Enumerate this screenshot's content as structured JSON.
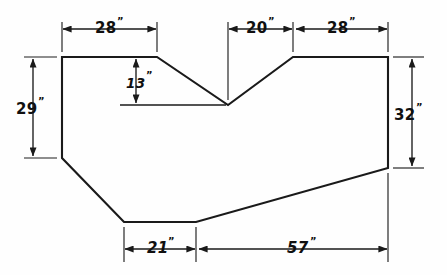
{
  "drawing": {
    "title": "Dimensioned plan outline with V-notch",
    "units_mark": "”",
    "stroke_color": "#1a1a1a",
    "background_color": "#fefefe",
    "canvas": {
      "width": 447,
      "height": 275
    }
  },
  "dimensions": {
    "top_left": {
      "label": "28",
      "mark": "”",
      "value": 28,
      "unit": "in",
      "position": "top",
      "span": "left flat edge"
    },
    "top_notch": {
      "label": "20",
      "mark": "”",
      "value": 20,
      "unit": "in",
      "position": "top",
      "span": "notch right slope run"
    },
    "top_right": {
      "label": "28",
      "mark": "”",
      "value": 28,
      "unit": "in",
      "position": "top",
      "span": "right flat edge"
    },
    "notch_depth": {
      "label": "13",
      "mark": "”",
      "value": 13,
      "unit": "in",
      "position": "interior",
      "span": "V-notch depth"
    },
    "left_height": {
      "label": "29",
      "mark": "”",
      "value": 29,
      "unit": "in",
      "position": "left",
      "span": "left vertical edge"
    },
    "right_height": {
      "label": "32",
      "mark": "”",
      "value": 32,
      "unit": "in",
      "position": "right",
      "span": "right vertical edge"
    },
    "bottom_left": {
      "label": "21",
      "mark": "”",
      "value": 21,
      "unit": "in",
      "position": "bottom",
      "span": "bottom flat left segment"
    },
    "bottom_right": {
      "label": "57",
      "mark": "”",
      "value": 57,
      "unit": "in",
      "position": "bottom",
      "span": "bottom long slope run"
    }
  },
  "shape": {
    "name": "polygon-outline",
    "vertex_count": 8,
    "description": "Closed polygon: top-left corner, left flat to notch slope, V-notch down and up, right flat to top-right corner, right vertical down, long bottom slope to bottom flat, bottom flat, lower-left bevel back to left vertical"
  }
}
